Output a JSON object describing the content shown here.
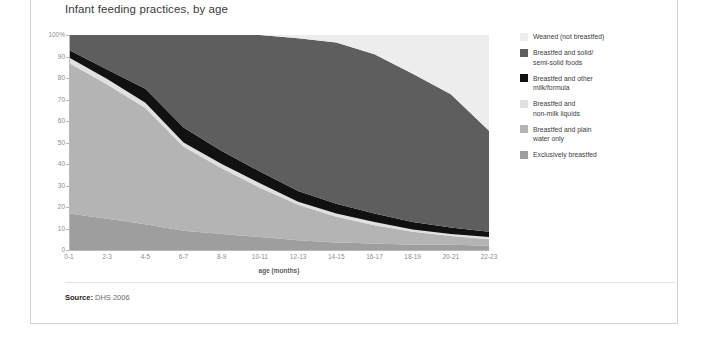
{
  "chart_title": "Infant feeding practices, by age",
  "source": {
    "label": "Source:",
    "value": " DHS 2006"
  },
  "legend": {
    "items": [
      {
        "label": "Weaned (not breastfed)",
        "color": "#ededed"
      },
      {
        "label": "Breastfed and solid/\nsemi-solid foods",
        "color": "#5e5e5e"
      },
      {
        "label": "Breastfed and other\nmilk/formula",
        "color": "#111111"
      },
      {
        "label": "Breastfed and\nnon-milk liquids",
        "color": "#e0e0e0"
      },
      {
        "label": "Breastfed and plain\nwater only",
        "color": "#b4b4b4"
      },
      {
        "label": "Exclusively breastfed",
        "color": "#9e9e9e"
      }
    ]
  },
  "chart_data": {
    "type": "area",
    "title": "Infant feeding practices, by age",
    "xlabel": "age (months)",
    "ylabel": "",
    "stacked": true,
    "stacked_percent": true,
    "grid": false,
    "legend_position": "right",
    "ylim": [
      0,
      100
    ],
    "ytick_labels": [
      "0",
      "10",
      "20",
      "30",
      "40",
      "50",
      "60",
      "70",
      "80",
      "90",
      "100%"
    ],
    "ytick_values": [
      0,
      10,
      20,
      30,
      40,
      50,
      60,
      70,
      80,
      90,
      100
    ],
    "categories": [
      "0-1",
      "2-3",
      "4-5",
      "6-7",
      "8-9",
      "10-11",
      "12-13",
      "14-15",
      "16-17",
      "18-19",
      "20-21",
      "22-23"
    ],
    "series": [
      {
        "name": "Exclusively breastfed",
        "color": "#9e9e9e",
        "values": [
          17,
          14.5,
          12,
          9,
          7.5,
          6,
          4.5,
          3.5,
          3,
          2.5,
          2.5,
          2
        ]
      },
      {
        "name": "Breastfed and plain water only",
        "color": "#b4b4b4",
        "values": [
          70,
          62.5,
          54,
          39,
          30.5,
          23,
          16.5,
          12,
          8.5,
          6,
          4,
          3
        ]
      },
      {
        "name": "Breastfed and non-milk liquids",
        "color": "#e0e0e0",
        "values": [
          2.5,
          2.5,
          2.5,
          2,
          2,
          2,
          1.5,
          1.5,
          1.5,
          1,
          1,
          1
        ]
      },
      {
        "name": "Breastfed and other milk/formula",
        "color": "#111111",
        "values": [
          3.5,
          4.5,
          6.5,
          7,
          6,
          5.5,
          5,
          4.5,
          4,
          3.5,
          3,
          2.5
        ]
      },
      {
        "name": "Breastfed and solid/semi-solid foods",
        "color": "#5e5e5e",
        "values": [
          7,
          16,
          25,
          43,
          54,
          63.5,
          71,
          75,
          74,
          69,
          62,
          47
        ]
      },
      {
        "name": "Weaned (not breastfed)",
        "color": "#ededed",
        "values": [
          0,
          0,
          0,
          0,
          0,
          0,
          1.5,
          3.5,
          9,
          18,
          27.5,
          44.5
        ]
      }
    ]
  }
}
